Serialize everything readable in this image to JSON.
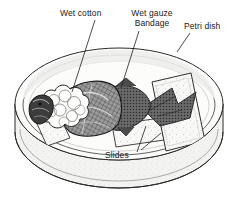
{
  "figure": {
    "background_color": "#ffffff",
    "ink_color": "#1a1a1a",
    "width": 238,
    "height": 212
  },
  "labels": [
    {
      "id": "wet-cotton",
      "text": "Wet cotton",
      "lines": [
        "Wet cotton"
      ],
      "x": 60,
      "y": 8,
      "leader": {
        "from_x": 95,
        "from_y": 20,
        "to_x": 72,
        "to_y": 92
      }
    },
    {
      "id": "wet-gauze-bandage",
      "text": "Wet gauze Bandage",
      "lines": [
        "Wet gauze",
        "Bandage"
      ],
      "x": 126,
      "y": 8,
      "leader": {
        "from_x": 139,
        "from_y": 31,
        "to_x": 121,
        "to_y": 88
      }
    },
    {
      "id": "petri-dish",
      "text": "Petri dish",
      "lines": [
        "Petri dish"
      ],
      "x": 184,
      "y": 21,
      "leader": {
        "from_x": 190,
        "from_y": 33,
        "to_x": 177,
        "to_y": 52
      }
    },
    {
      "id": "slides",
      "text": "Slides",
      "lines": [
        "Slides"
      ],
      "x": 105,
      "y": 150,
      "leader_a": {
        "from_x": 137,
        "from_y": 152,
        "to_x": 146,
        "to_y": 126
      },
      "leader_b": {
        "from_x": 141,
        "from_y": 150,
        "to_x": 161,
        "to_y": 133
      }
    }
  ],
  "parts": {
    "petri_dish_label": "Petri dish",
    "cotton_label": "Wet cotton",
    "gauze_label": "Wet gauze",
    "bandage_label": "Bandage",
    "slides_label": "Slides"
  },
  "colors": {
    "ink": "#1a1a1a",
    "line": "#2b2b2b",
    "dish_wall_fill": "#f2f2f0",
    "dish_floor_fill": "#fbfbfa",
    "slide_fill": "#f7f7f5",
    "cotton_fill": "#fdfdfc",
    "gauze_fill": "#8e8e8e",
    "fish_fill": "#5f5f5f",
    "stipple": "#9a9a9a"
  }
}
